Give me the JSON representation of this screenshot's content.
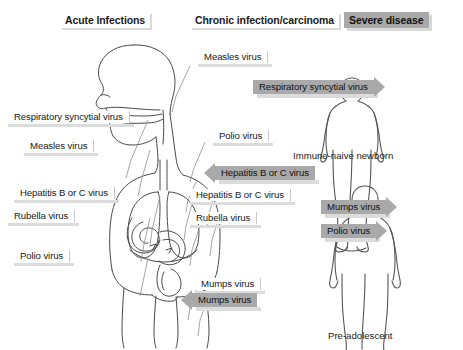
{
  "headers": [
    {
      "id": "acute",
      "label": "Acute Infections",
      "style": "light",
      "x": 60,
      "y": 12
    },
    {
      "id": "chronic",
      "label": "Chronic infection/carcinoma",
      "style": "light",
      "x": 190,
      "y": 12
    },
    {
      "id": "severe",
      "label": "Severe disease",
      "style": "dark",
      "x": 344,
      "y": 12
    }
  ],
  "left_column": [
    {
      "id": "rsv",
      "label": "Respiratory syncytial virus",
      "x": 8,
      "y": 110
    },
    {
      "id": "measles",
      "label": "Measles virus",
      "x": 24,
      "y": 139
    },
    {
      "id": "hepbc",
      "label": "Hepatitis B or C virus",
      "x": 14,
      "y": 186
    },
    {
      "id": "rubella",
      "label": "Rubella virus",
      "x": 8,
      "y": 209
    },
    {
      "id": "polio",
      "label": "Polio virus",
      "x": 14,
      "y": 249
    }
  ],
  "middle_column": [
    {
      "id": "measles-mid",
      "label": "Measles virus",
      "x": 198,
      "y": 50,
      "kind": "plain"
    },
    {
      "id": "rsv-mid",
      "label": "Respiratory syncytial virus",
      "x": 253,
      "y": 80,
      "kind": "gray-right"
    },
    {
      "id": "polio-mid",
      "label": "Polio virus",
      "x": 213,
      "y": 129,
      "kind": "plain"
    },
    {
      "id": "hepbc-mid-gray",
      "label": "Hepatitis B or C virus",
      "x": 215,
      "y": 166,
      "kind": "gray-left"
    },
    {
      "id": "hepbc-mid",
      "label": "Hepatitis B or C virus",
      "x": 190,
      "y": 188,
      "kind": "plain"
    },
    {
      "id": "rubella-mid",
      "label": "Rubella virus",
      "x": 190,
      "y": 211,
      "kind": "plain"
    },
    {
      "id": "mumps-mid",
      "label": "Mumps virus",
      "x": 195,
      "y": 277,
      "kind": "plain"
    },
    {
      "id": "mumps-mid-gray",
      "label": "Mumps virus",
      "x": 192,
      "y": 293,
      "kind": "gray-left"
    }
  ],
  "right_column": [
    {
      "id": "mumps-severe",
      "label": "Mumps virus",
      "x": 321,
      "y": 200,
      "kind": "gray-right"
    },
    {
      "id": "polio-severe",
      "label": "Polio virus",
      "x": 321,
      "y": 224,
      "kind": "gray-right"
    }
  ],
  "figures": [
    {
      "id": "newborn",
      "caption": "Immune-naive newborn",
      "cx": 352,
      "cy": 155
    },
    {
      "id": "preadolescent",
      "caption": "Pre-adolescent",
      "cx": 365,
      "cy": 333
    }
  ],
  "colors": {
    "gray_banner": "#a9a9a9",
    "shadow": "#dcdcdc",
    "line": "#4a4a4a",
    "text": "#1a1a1a",
    "background": "#ffffff"
  }
}
